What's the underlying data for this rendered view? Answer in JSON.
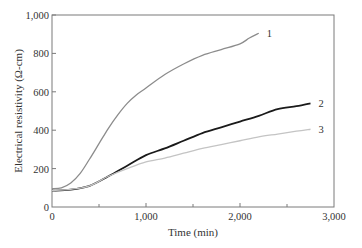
{
  "chart_data": {
    "type": "line",
    "title": "",
    "xlabel": "Time (min)",
    "ylabel": "Electrical resistivity (Ω-cm)",
    "xlim": [
      0,
      3000
    ],
    "ylim": [
      0,
      1000
    ],
    "x_ticks": [
      "0",
      "1,000",
      "2,000",
      "3,000"
    ],
    "x_minor_ticks": [
      500,
      1500,
      2500
    ],
    "y_ticks": [
      "0",
      "200",
      "400",
      "600",
      "800",
      "1,000"
    ],
    "grid": false,
    "legend": "inline labels at line ends",
    "series": [
      {
        "name": "1",
        "color": "#8c8c8c",
        "x": [
          0,
          100,
          200,
          300,
          400,
          500,
          600,
          700,
          800,
          900,
          1000,
          1200,
          1400,
          1600,
          1800,
          2000,
          2100,
          2200
        ],
        "values": [
          95,
          100,
          125,
          175,
          250,
          330,
          410,
          480,
          540,
          585,
          620,
          690,
          745,
          790,
          820,
          850,
          880,
          905
        ]
      },
      {
        "name": "2",
        "color": "#1a1a1a",
        "x": [
          0,
          200,
          400,
          600,
          800,
          1000,
          1200,
          1400,
          1600,
          1800,
          2000,
          2200,
          2400,
          2600,
          2750
        ],
        "values": [
          85,
          90,
          110,
          160,
          215,
          270,
          305,
          345,
          385,
          415,
          445,
          475,
          510,
          525,
          540
        ]
      },
      {
        "name": "3",
        "color": "#c4c4c4",
        "x": [
          0,
          200,
          400,
          600,
          800,
          1000,
          1200,
          1400,
          1600,
          1800,
          2000,
          2200,
          2400,
          2600,
          2750
        ],
        "values": [
          85,
          92,
          110,
          160,
          200,
          235,
          255,
          280,
          305,
          325,
          345,
          365,
          380,
          395,
          405
        ]
      }
    ]
  },
  "labels": {
    "xlabel": "Time (min)",
    "ylabel": "Electrical resistivity (Ω-cm)",
    "x_ticks": [
      "0",
      "1,000",
      "2,000",
      "3,000"
    ],
    "y_ticks": [
      "0",
      "200",
      "400",
      "600",
      "800",
      "1,000"
    ],
    "series_labels": [
      "1",
      "2",
      "3"
    ]
  }
}
